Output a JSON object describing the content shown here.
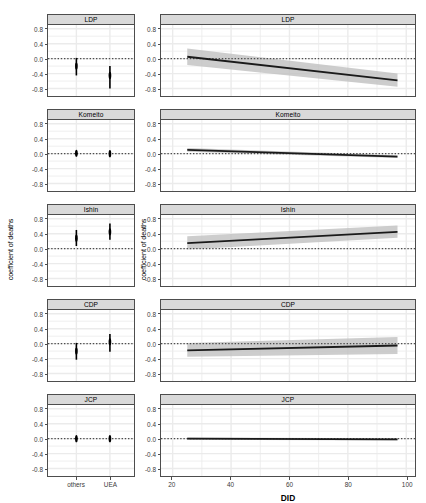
{
  "chart_data": [
    {
      "type": "scatter",
      "title": "LDP",
      "panel_column": "left",
      "xlabel": "",
      "ylabel": "coefficient of deaths",
      "categories": [
        "others",
        "UEA"
      ],
      "values": [
        -0.2,
        -0.45
      ],
      "ci_low": [
        -0.45,
        -0.8
      ],
      "ci_high": [
        0.02,
        -0.2
      ],
      "ylim": [
        -1.0,
        0.9
      ],
      "yticks": [
        0.8,
        0.4,
        0.0,
        -0.4,
        -0.8
      ],
      "zero_reference_line": 0.0,
      "grid": true,
      "legend": "none"
    },
    {
      "type": "scatter",
      "title": "Komeito",
      "panel_column": "left",
      "xlabel": "",
      "ylabel": "coefficient of deaths",
      "categories": [
        "others",
        "UEA"
      ],
      "values": [
        0.01,
        0.0
      ],
      "ci_low": [
        -0.04,
        -0.04
      ],
      "ci_high": [
        0.06,
        0.05
      ],
      "ylim": [
        -1.0,
        0.9
      ],
      "yticks": [
        0.8,
        0.4,
        0.0,
        -0.4,
        -0.8
      ],
      "zero_reference_line": 0.0,
      "grid": true,
      "legend": "none"
    },
    {
      "type": "scatter",
      "title": "Ishin",
      "panel_column": "left",
      "xlabel": "",
      "ylabel": "coefficient of deaths",
      "categories": [
        "others",
        "UEA"
      ],
      "values": [
        0.28,
        0.45
      ],
      "ci_low": [
        0.07,
        0.24
      ],
      "ci_high": [
        0.5,
        0.67
      ],
      "ylim": [
        -1.0,
        0.9
      ],
      "yticks": [
        0.8,
        0.4,
        0.0,
        -0.4,
        -0.8
      ],
      "zero_reference_line": 0.0,
      "grid": true,
      "legend": "none"
    },
    {
      "type": "scatter",
      "title": "CDP",
      "panel_column": "left",
      "xlabel": "",
      "ylabel": "coefficient of deaths",
      "categories": [
        "others",
        "UEA"
      ],
      "values": [
        -0.2,
        0.05
      ],
      "ci_low": [
        -0.43,
        -0.22
      ],
      "ci_high": [
        0.02,
        0.26
      ],
      "ylim": [
        -1.0,
        0.9
      ],
      "yticks": [
        0.8,
        0.4,
        0.0,
        -0.4,
        -0.8
      ],
      "zero_reference_line": 0.0,
      "grid": true,
      "legend": "none"
    },
    {
      "type": "scatter",
      "title": "JCP",
      "panel_column": "left",
      "xlabel": "",
      "ylabel": "coefficient of deaths",
      "categories": [
        "others",
        "UEA"
      ],
      "values": [
        0.0,
        0.0
      ],
      "ci_low": [
        -0.03,
        -0.03
      ],
      "ci_high": [
        0.03,
        0.03
      ],
      "ylim": [
        -1.0,
        0.9
      ],
      "yticks": [
        0.8,
        0.4,
        0.0,
        -0.4,
        -0.8
      ],
      "zero_reference_line": 0.0,
      "grid": true,
      "legend": "none"
    },
    {
      "type": "line",
      "title": "LDP",
      "panel_column": "right",
      "xlabel": "DID",
      "ylabel": "coefficient of deaths",
      "x": [
        25,
        97
      ],
      "values": [
        0.05,
        -0.58
      ],
      "band_low": [
        -0.17,
        -0.75
      ],
      "band_high": [
        0.27,
        -0.4
      ],
      "xlim": [
        16,
        103
      ],
      "ylim": [
        -1.0,
        0.9
      ],
      "xticks": [
        20,
        40,
        60,
        80,
        100
      ],
      "yticks": [
        0.8,
        0.4,
        0.0,
        -0.4,
        -0.8
      ],
      "zero_reference_line": 0.0,
      "grid": true,
      "legend": "none"
    },
    {
      "type": "line",
      "title": "Komeito",
      "panel_column": "right",
      "xlabel": "DID",
      "ylabel": "coefficient of deaths",
      "x": [
        25,
        97
      ],
      "values": [
        0.1,
        -0.08
      ],
      "band_low": [
        0.05,
        -0.12
      ],
      "band_high": [
        0.15,
        -0.04
      ],
      "xlim": [
        16,
        103
      ],
      "ylim": [
        -1.0,
        0.9
      ],
      "xticks": [
        20,
        40,
        60,
        80,
        100
      ],
      "yticks": [
        0.8,
        0.4,
        0.0,
        -0.4,
        -0.8
      ],
      "zero_reference_line": 0.0,
      "grid": true,
      "legend": "none"
    },
    {
      "type": "line",
      "title": "Ishin",
      "panel_column": "right",
      "xlabel": "DID",
      "ylabel": "coefficient of deaths",
      "x": [
        25,
        97
      ],
      "values": [
        0.15,
        0.45
      ],
      "band_low": [
        -0.02,
        0.29
      ],
      "band_high": [
        0.33,
        0.62
      ],
      "xlim": [
        16,
        103
      ],
      "ylim": [
        -1.0,
        0.9
      ],
      "xticks": [
        20,
        40,
        60,
        80,
        100
      ],
      "yticks": [
        0.8,
        0.4,
        0.0,
        -0.4,
        -0.8
      ],
      "zero_reference_line": 0.0,
      "grid": true,
      "legend": "none"
    },
    {
      "type": "line",
      "title": "CDP",
      "panel_column": "right",
      "xlabel": "DID",
      "ylabel": "coefficient of deaths",
      "x": [
        25,
        97
      ],
      "values": [
        -0.18,
        -0.05
      ],
      "band_low": [
        -0.35,
        -0.28
      ],
      "band_high": [
        0.02,
        0.18
      ],
      "xlim": [
        16,
        103
      ],
      "ylim": [
        -1.0,
        0.9
      ],
      "xticks": [
        20,
        40,
        60,
        80,
        100
      ],
      "yticks": [
        0.8,
        0.4,
        0.0,
        -0.4,
        -0.8
      ],
      "zero_reference_line": 0.0,
      "grid": true,
      "legend": "none"
    },
    {
      "type": "line",
      "title": "JCP",
      "panel_column": "right",
      "xlabel": "DID",
      "ylabel": "coefficient of deaths",
      "x": [
        25,
        97
      ],
      "values": [
        0.0,
        -0.02
      ],
      "band_low": [
        -0.03,
        -0.05
      ],
      "band_high": [
        0.03,
        0.01
      ],
      "xlim": [
        16,
        103
      ],
      "ylim": [
        -1.0,
        0.9
      ],
      "xticks": [
        20,
        40,
        60,
        80,
        100
      ],
      "yticks": [
        0.8,
        0.4,
        0.0,
        -0.4,
        -0.8
      ],
      "zero_reference_line": 0.0,
      "grid": true,
      "legend": "none"
    }
  ],
  "axis_titles": {
    "left_y": "coefficient of deaths",
    "right_y": "coefficient of deaths",
    "right_x": "DID"
  },
  "colors": {
    "point": "#000000",
    "line": "#1a1a1a",
    "ribbon": "#bfbfbf",
    "strip_background": "#d9d9d9",
    "panel_border": "#4d4d4d",
    "grid": "#ebebeb",
    "reference_line": "#4d4d4d",
    "tick_label": "#3a3a3a"
  }
}
